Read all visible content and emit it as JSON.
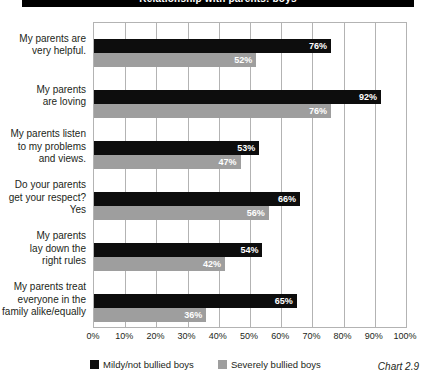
{
  "title_bar": {
    "text": "Relationship with parents: boys"
  },
  "caption": "Chart 2.9",
  "legend": {
    "items": [
      {
        "label": "Mildy/not bullied boys",
        "color": "#0d0d0d",
        "swatch": "dark"
      },
      {
        "label": "Severely bullied boys",
        "color": "#9e9e9e",
        "swatch": "light"
      }
    ]
  },
  "axis": {
    "ticks": [
      "0%",
      "10%",
      "20%",
      "30%",
      "40%",
      "50%",
      "60%",
      "70%",
      "80%",
      "90%",
      "100%"
    ]
  },
  "chart_data": {
    "type": "bar",
    "orientation": "horizontal",
    "title": "Relationship with parents: boys",
    "caption": "Chart 2.9",
    "xlabel": "",
    "ylabel": "",
    "xlim": [
      0,
      100
    ],
    "xtick_values": [
      0,
      10,
      20,
      30,
      40,
      50,
      60,
      70,
      80,
      90,
      100
    ],
    "xtick_labels": [
      "0%",
      "10%",
      "20%",
      "30%",
      "40%",
      "50%",
      "60%",
      "70%",
      "80%",
      "90%",
      "100%"
    ],
    "grid": true,
    "legend_position": "bottom-left",
    "categories": [
      "My parents are very helpful.",
      "My parents are loving",
      "My parents listen to my problems and views.",
      "Do your parents get your respect? Yes",
      "My parents lay down the right rules",
      "My parents treat everyone in the family alike/equally"
    ],
    "category_lines": [
      [
        "My parents are",
        "very helpful."
      ],
      [
        "My parents",
        "are loving"
      ],
      [
        "My parents listen",
        "to my problems",
        "and views."
      ],
      [
        "Do your parents",
        "get your respect?",
        "Yes"
      ],
      [
        "My parents",
        "lay down the",
        "right rules"
      ],
      [
        "My parents treat",
        "everyone in the",
        "family alike/equally"
      ]
    ],
    "series": [
      {
        "name": "Mildy/not bullied boys",
        "color": "#0d0d0d",
        "values": [
          76,
          92,
          53,
          66,
          54,
          65
        ],
        "labels": [
          "76%",
          "92%",
          "53%",
          "66%",
          "54%",
          "65%"
        ]
      },
      {
        "name": "Severely bullied boys",
        "color": "#9e9e9e",
        "values": [
          52,
          76,
          47,
          56,
          42,
          36
        ],
        "labels": [
          "52%",
          "76%",
          "47%",
          "56%",
          "42%",
          "36%"
        ]
      }
    ]
  }
}
